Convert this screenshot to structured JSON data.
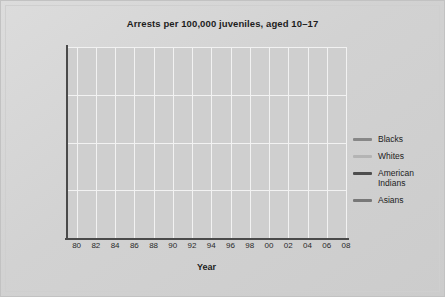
{
  "chart_data": {
    "type": "line",
    "title": "Arrests per 100,000 juveniles, aged 10–17",
    "xlabel": "Year",
    "ylabel": "",
    "xlim": [
      1979,
      2008
    ],
    "ylim": [
      0,
      20000
    ],
    "grid": true,
    "legend_position": "right",
    "ytick_labels": [
      "0",
      "5,000",
      "10,000",
      "15,000",
      "20,000"
    ],
    "ytick_values": [
      0,
      5000,
      10000,
      15000,
      20000
    ],
    "xtick_labels": [
      "80",
      "82",
      "84",
      "86",
      "88",
      "90",
      "92",
      "94",
      "96",
      "98",
      "00",
      "02",
      "04",
      "06",
      "08"
    ],
    "xtick_values": [
      1980,
      1982,
      1984,
      1986,
      1988,
      1990,
      1992,
      1994,
      1996,
      1998,
      2000,
      2002,
      2004,
      2006,
      2008
    ],
    "x": [
      1979,
      1980,
      1981,
      1982,
      1983,
      1984,
      1985,
      1986,
      1987,
      1988,
      1989,
      1990,
      1991,
      1992,
      1993,
      1994,
      1995,
      1996,
      1997,
      1998,
      1999,
      2000,
      2001,
      2002,
      2003,
      2004,
      2005,
      2006,
      2007,
      2008
    ],
    "series": [
      {
        "name": "Blacks",
        "color": "#878787",
        "values": [
          11600,
          12400,
          13200,
          12400,
          11800,
          11900,
          12400,
          12900,
          13200,
          13500,
          14800,
          14200,
          14900,
          15600,
          16300,
          17200,
          17600,
          16700,
          15100,
          13300,
          12000,
          11500,
          11300,
          10800,
          10900,
          11100,
          11600,
          12300,
          12200,
          12300
        ]
      },
      {
        "name": "Whites",
        "color": "#b4b4b4",
        "values": [
          7500,
          6900,
          6700,
          6500,
          6300,
          6200,
          6500,
          6600,
          6600,
          6800,
          7000,
          6900,
          7100,
          7200,
          7200,
          7500,
          8000,
          8600,
          8700,
          8500,
          7700,
          7100,
          6800,
          6500,
          6300,
          6200,
          6100,
          6000,
          6000,
          5800
        ]
      },
      {
        "name": "American\nIndians",
        "color": "#4e4e4e",
        "values": [
          7400,
          6500,
          6300,
          6100,
          5400,
          5600,
          5800,
          6600,
          6200,
          6400,
          6500,
          6900,
          7100,
          7000,
          7200,
          7800,
          8500,
          9000,
          8700,
          8800,
          7400,
          6900,
          6200,
          5900,
          6000,
          6000,
          5900,
          5700,
          6000,
          5700
        ]
      },
      {
        "name": "Asians",
        "color": "#787878",
        "values": [
          3500,
          3300,
          3250,
          3100,
          2900,
          2850,
          3000,
          3050,
          3150,
          3900,
          2300,
          3500,
          3800,
          3950,
          4200,
          4400,
          4300,
          4600,
          4400,
          3500,
          3300,
          3100,
          2800,
          2750,
          2600,
          2400,
          2100,
          2250,
          1550,
          2200
        ]
      }
    ]
  },
  "legend": {
    "items": [
      {
        "label": "Blacks",
        "color": "#878787"
      },
      {
        "label": "Whites",
        "color": "#b4b4b4"
      },
      {
        "label": "American\nIndians",
        "color": "#4e4e4e"
      },
      {
        "label": "Asians",
        "color": "#787878"
      }
    ]
  }
}
